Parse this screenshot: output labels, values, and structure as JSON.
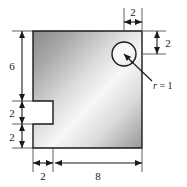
{
  "figure": {
    "type": "engineering-dimensioned-drawing",
    "background_color": "#ffffff",
    "outline_color": "#1a1a1a",
    "fill_gradient": {
      "from": "#8d8d8d",
      "mid": "#fbfbfb",
      "to": "#9a9a9a",
      "direction": "135deg-diagonal"
    }
  },
  "dimensions": {
    "left_upper": "6",
    "left_middle": "2",
    "left_lower": "2",
    "bottom_left": "2",
    "bottom_right": "8",
    "top_right": "2",
    "right_upper": "2"
  },
  "annotations": {
    "radius": {
      "symbol": "r",
      "equals": "=",
      "value": "1",
      "full": "r = 1"
    }
  },
  "geometry": {
    "plate": {
      "left": 33,
      "top": 31,
      "right": 142,
      "bottom": 148
    },
    "notch": {
      "left": 33,
      "top": 101,
      "right": 53,
      "bottom": 124
    },
    "hole": {
      "center_x": 124,
      "center_y": 54,
      "radius": 12
    }
  }
}
